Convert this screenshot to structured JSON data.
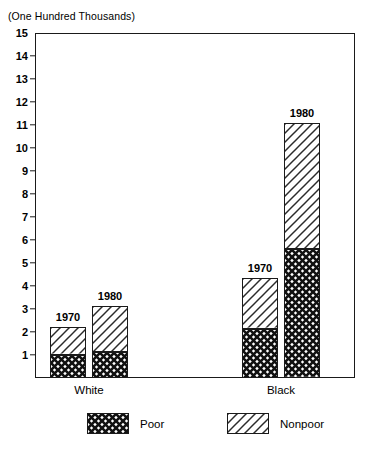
{
  "chart_data": {
    "type": "bar",
    "title": "(One Hundred Thousands)",
    "subtitle": "",
    "xlabel": "",
    "ylabel": "(One Hundred Thousands)",
    "ylim": [
      0,
      15
    ],
    "grid": false,
    "stacked": true,
    "legend_position": "bottom",
    "categories": [
      "White 1970",
      "White 1980",
      "Black 1970",
      "Black 1980"
    ],
    "groups": [
      {
        "name": "White",
        "bars": [
          {
            "label": "1970",
            "poor": 1.0,
            "nonpoor": 1.2,
            "total": 2.2
          },
          {
            "label": "1980",
            "poor": 1.15,
            "nonpoor": 2.0,
            "total": 3.15
          }
        ]
      },
      {
        "name": "Black",
        "bars": [
          {
            "label": "1970",
            "poor": 2.15,
            "nonpoor": 2.2,
            "total": 4.35
          },
          {
            "label": "1980",
            "poor": 5.6,
            "nonpoor": 5.5,
            "total": 11.1
          }
        ]
      }
    ],
    "series": [
      {
        "name": "Poor",
        "pattern": "crosshatch",
        "values": [
          1.0,
          1.15,
          2.15,
          5.6
        ]
      },
      {
        "name": "Nonpoor",
        "pattern": "diagonal-hatch",
        "values": [
          1.2,
          2.0,
          2.2,
          5.5
        ]
      }
    ],
    "y_ticks": [
      1,
      2,
      3,
      4,
      5,
      6,
      7,
      8,
      9,
      10,
      11,
      12,
      13,
      14,
      15
    ],
    "y_tick_labels": [
      "1",
      "2",
      "3",
      "4",
      "5",
      "6",
      "7",
      "8",
      "9",
      "10",
      "11",
      "12",
      "13",
      "14",
      "15"
    ],
    "legend": [
      {
        "label": "Poor",
        "pattern": "crosshatch"
      },
      {
        "label": "Nonpoor",
        "pattern": "diagonal-hatch"
      }
    ],
    "group_labels": [
      "White",
      "Black"
    ],
    "colors": {
      "axis": "#1a1a1a",
      "bar_fill": "#ffffff",
      "bar_stroke": "#1a1a1a",
      "background": "#ffffff"
    }
  }
}
